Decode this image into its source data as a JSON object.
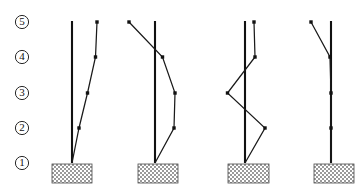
{
  "figure": {
    "width": 363,
    "height": 191,
    "background_color": "#ffffff",
    "line_color": "#111111",
    "ground_fill_color": "#b0b0b0"
  },
  "levels": [
    {
      "id": "level-5",
      "label": "5",
      "y": 22
    },
    {
      "id": "level-4",
      "label": "4",
      "y": 57
    },
    {
      "id": "level-3",
      "label": "3",
      "y": 93
    },
    {
      "id": "level-2",
      "label": "2",
      "y": 128
    },
    {
      "id": "level-1",
      "label": "1",
      "y": 163
    }
  ],
  "level_label_x": 22,
  "modes": [
    {
      "name": "mode-1",
      "column_x": 72,
      "base_y": 163,
      "top_y": 21,
      "ground": {
        "x": 52,
        "y": 164,
        "width": 40,
        "height": 19
      },
      "nodes": [
        {
          "level": "1",
          "x": 72,
          "y": 163
        },
        {
          "level": "2",
          "x": 79,
          "y": 128
        },
        {
          "level": "3",
          "x": 87.5,
          "y": 93
        },
        {
          "level": "4",
          "x": 95.5,
          "y": 57
        },
        {
          "level": "5",
          "x": 97,
          "y": 22
        }
      ]
    },
    {
      "name": "mode-2",
      "column_x": 155,
      "base_y": 163,
      "top_y": 21,
      "ground": {
        "x": 138,
        "y": 164,
        "width": 40,
        "height": 19
      },
      "nodes": [
        {
          "level": "1",
          "x": 155,
          "y": 163
        },
        {
          "level": "2",
          "x": 174,
          "y": 128
        },
        {
          "level": "3",
          "x": 175,
          "y": 93
        },
        {
          "level": "4",
          "x": 162.5,
          "y": 57
        },
        {
          "level": "5",
          "x": 129,
          "y": 22
        }
      ]
    },
    {
      "name": "mode-3",
      "column_x": 245,
      "base_y": 163,
      "top_y": 21,
      "ground": {
        "x": 228,
        "y": 164,
        "width": 41,
        "height": 19
      },
      "nodes": [
        {
          "level": "1",
          "x": 245,
          "y": 163
        },
        {
          "level": "2",
          "x": 265,
          "y": 128
        },
        {
          "level": "3",
          "x": 227.5,
          "y": 93
        },
        {
          "level": "4",
          "x": 255,
          "y": 57
        },
        {
          "level": "5",
          "x": 254,
          "y": 22
        }
      ]
    },
    {
      "name": "mode-4",
      "column_x": 331,
      "base_y": 163,
      "top_y": 21,
      "ground": {
        "x": 314,
        "y": 164,
        "width": 40,
        "height": 19
      },
      "nodes": [
        {
          "level": "1",
          "x": 331,
          "y": 163
        },
        {
          "level": "2",
          "x": 331,
          "y": 128
        },
        {
          "level": "3",
          "x": 331,
          "y": 93
        },
        {
          "level": "4",
          "x": 330,
          "y": 57
        },
        {
          "level": "5",
          "x": 311,
          "y": 22
        }
      ]
    }
  ]
}
